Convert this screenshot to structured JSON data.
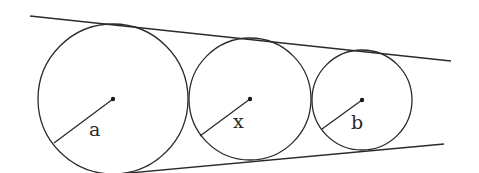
{
  "diagram": {
    "lines": {
      "top": {
        "x1": 30,
        "y1": 16,
        "x2": 451,
        "y2": 61
      },
      "bottom": {
        "x1": 130,
        "y1": 173,
        "x2": 444,
        "y2": 144
      }
    },
    "circles": [
      {
        "id": "a",
        "label": "a",
        "cx": 113,
        "cy": 99,
        "r": 75,
        "radius_end": {
          "x": 54,
          "y": 143
        },
        "label_pos": {
          "x": 89,
          "y": 136
        }
      },
      {
        "id": "x",
        "label": "x",
        "cx": 250,
        "cy": 99,
        "r": 61,
        "radius_end": {
          "x": 200,
          "y": 136
        },
        "label_pos": {
          "x": 233,
          "y": 128
        }
      },
      {
        "id": "b",
        "label": "b",
        "cx": 362,
        "cy": 100,
        "r": 50,
        "radius_end": {
          "x": 322,
          "y": 129
        },
        "label_pos": {
          "x": 351,
          "y": 129
        }
      }
    ]
  },
  "labels": {
    "a": "a",
    "x": "x",
    "b": "b"
  }
}
